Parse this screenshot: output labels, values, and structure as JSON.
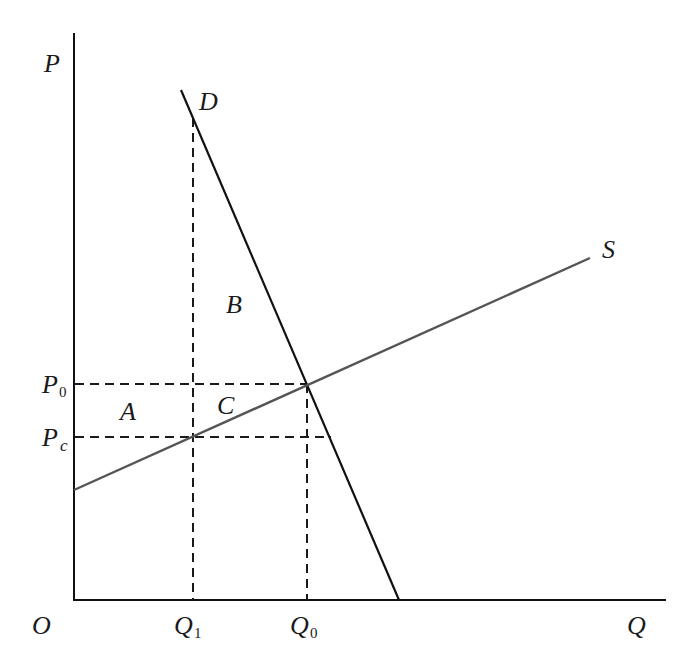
{
  "diagram": {
    "type": "supply-demand price ceiling",
    "axes": {
      "y_label": "P",
      "x_label": "Q",
      "origin_label": "O"
    },
    "curves": {
      "demand": {
        "label": "D",
        "color": "#111111"
      },
      "supply": {
        "label": "S",
        "color": "#555555"
      }
    },
    "price_levels": [
      {
        "name": "P0",
        "main": "P",
        "sub": "0"
      },
      {
        "name": "Pc",
        "main": "P",
        "sub": "c"
      }
    ],
    "quantity_levels": [
      {
        "name": "Q1",
        "main": "Q",
        "sub": "1"
      },
      {
        "name": "Q0",
        "main": "Q",
        "sub": "0"
      }
    ],
    "regions": {
      "a": "A",
      "b": "B",
      "c": "C"
    },
    "colors": {
      "axis": "#111111",
      "dashed": "#1a1a1a",
      "background": "#ffffff"
    }
  }
}
